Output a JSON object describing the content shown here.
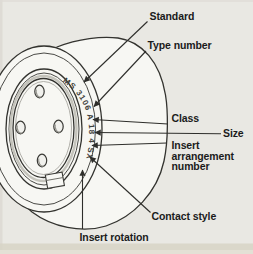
{
  "diagram": {
    "marking": "MS 3106 A 18 4 SX",
    "labels": {
      "standard": "Standard",
      "type_number": "Type number",
      "class": "Class",
      "size": "Size",
      "insert_line1": "Insert",
      "insert_line2": "arrangement",
      "insert_line3": "number",
      "contact_style": "Contact style",
      "insert_rotation": "Insert rotation"
    },
    "colors": {
      "background": "#e9e8e3",
      "drawing_fill": "#f7f7f3",
      "line": "#33332f",
      "label_text": "#1b1b1b",
      "bottom_edge_band": "#d7d3c6"
    }
  }
}
